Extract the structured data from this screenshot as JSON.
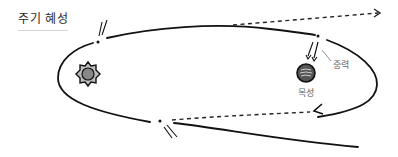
{
  "title": "주기 혜성",
  "labels": {
    "gravity": "중력",
    "jupiter": "목성"
  },
  "elements": {
    "sun": {
      "icon": "sun-icon",
      "color": "#888888"
    },
    "jupiter": {
      "icon": "jupiter-icon",
      "color": "#555555"
    },
    "comet": {
      "icon": "comet-icon"
    }
  },
  "colors": {
    "orbit": "#111111",
    "dashed_path": "#222222",
    "label": "#666666"
  }
}
